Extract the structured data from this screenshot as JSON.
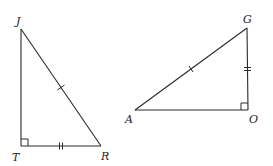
{
  "diagram": {
    "type": "geometry",
    "triangles": [
      {
        "name": "triangle-JTR",
        "vertices": {
          "J": {
            "label": "J",
            "x": 21,
            "y": 29
          },
          "T": {
            "label": "T",
            "x": 21,
            "y": 146
          },
          "R": {
            "label": "R",
            "x": 101,
            "y": 146
          }
        },
        "right_angle_at": "T",
        "tick_marks": {
          "JR": 1,
          "TR": 2
        }
      },
      {
        "name": "triangle-GOA",
        "vertices": {
          "G": {
            "label": "G",
            "x": 247,
            "y": 28
          },
          "O": {
            "label": "O",
            "x": 248,
            "y": 110
          },
          "A": {
            "label": "A",
            "x": 135,
            "y": 110
          }
        },
        "right_angle_at": "O",
        "tick_marks": {
          "AG": 1,
          "GO": 2
        }
      }
    ],
    "labels": {
      "J": "J",
      "T": "T",
      "R": "R",
      "G": "G",
      "A": "A",
      "O": "O"
    },
    "stroke_color": "#2a2a2a"
  }
}
